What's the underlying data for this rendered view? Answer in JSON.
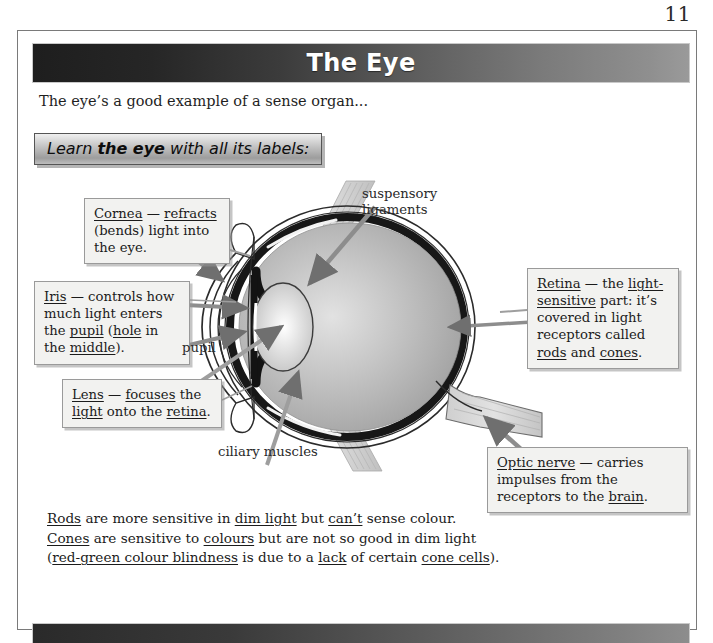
{
  "page": {
    "number": "11"
  },
  "header": {
    "title": "The Eye"
  },
  "intro": {
    "text": "The eye’s a good example of a sense organ..."
  },
  "learn_box": {
    "prefix": "Learn ",
    "bold": "the eye",
    "suffix": " with all its labels:"
  },
  "callouts": {
    "cornea": {
      "name": "Cornea",
      "html": "<u>Cornea</u> — <u>refracts</u> (bends) light into the eye."
    },
    "iris": {
      "name": "Iris",
      "html": "<u>Iris</u> — controls how much light enters the <u>pupil</u> (<u>hole</u> in the <u>middle</u>)."
    },
    "lens": {
      "name": "Lens",
      "html": "<u>Lens</u> — <u>focuses</u> the <u>light</u> onto the <u>retina</u>."
    },
    "retina": {
      "name": "Retina",
      "html": "<u>Retina</u> — the <u>light-sensitive</u> part: it’s covered in light receptors called <u>rods</u> and <u>cones</u>."
    },
    "optic_nerve": {
      "name": "Optic nerve",
      "html": "<u>Optic nerve</u> — carries impulses from the receptors to the <u>brain</u>."
    }
  },
  "diagram_labels": {
    "suspensory_ligaments": "suspensory\nligaments",
    "suspensory_line1": "suspensory",
    "suspensory_line2": "ligaments",
    "pupil": "pupil",
    "ciliary_muscles": "ciliary muscles"
  },
  "bottom_text": {
    "line1_html": "<u>Rods</u> are more sensitive in <u>dim light</u> but <u>can’t</u> sense colour.",
    "line2_html": "<u>Cones</u> are sensitive to <u>colours</u> but are not so good in dim light",
    "line3_html": "(<u>red-green colour blindness</u> is due to a <u>lack</u> of certain <u>cone cells</u>)."
  },
  "colors": {
    "banner_dark": "#1e1e1e",
    "banner_light": "#9a9a9a",
    "callout_bg": "#f2f2f0",
    "eye_body": "#b4b4b4",
    "page_border": "#7a7a7a"
  }
}
